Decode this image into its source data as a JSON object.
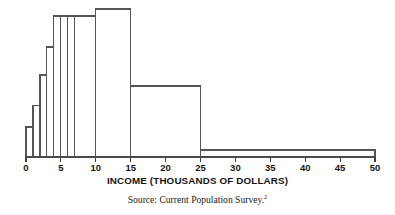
{
  "figure": {
    "axis_title": "INCOME (THOUSANDS OF DOLLARS)",
    "source_text": "Source: Current Population Survey.",
    "source_footnote_marker": "2",
    "line_color": "#555555",
    "text_color": "#141414"
  },
  "chart_data": {
    "type": "bar",
    "title": "",
    "subtitle": "",
    "xlabel": "INCOME (THOUSANDS OF DOLLARS)",
    "ylabel": "",
    "xlim": [
      0,
      50
    ],
    "ylim": [
      0,
      1
    ],
    "grid": false,
    "legend": "none",
    "note": "Histogram of family income with unequal class intervals; vertical axis is density (unlabeled, no ticks).",
    "tick_labels": [
      "0",
      "5",
      "10",
      "15",
      "20",
      "25",
      "30",
      "35",
      "40",
      "45",
      "50"
    ],
    "tick_values": [
      0,
      5,
      10,
      15,
      20,
      25,
      30,
      35,
      40,
      45,
      50
    ],
    "bins": [
      {
        "label": "0-1",
        "x0": 0,
        "x1": 1,
        "density": 0.203
      },
      {
        "label": "1-2",
        "x0": 1,
        "x1": 2,
        "density": 0.351
      },
      {
        "label": "2-3",
        "x0": 2,
        "x1": 3,
        "density": 0.554
      },
      {
        "label": "3-4",
        "x0": 3,
        "x1": 4,
        "density": 0.743
      },
      {
        "label": "4-5",
        "x0": 4,
        "x1": 5,
        "density": 0.953
      },
      {
        "label": "5-6",
        "x0": 5,
        "x1": 6,
        "density": 0.953
      },
      {
        "label": "6-7",
        "x0": 6,
        "x1": 7,
        "density": 0.953
      },
      {
        "label": "7-10",
        "x0": 7,
        "x1": 10,
        "density": 0.953
      },
      {
        "label": "10-15",
        "x0": 10,
        "x1": 15,
        "density": 1.0
      },
      {
        "label": "15-25",
        "x0": 15,
        "x1": 25,
        "density": 0.48
      },
      {
        "label": "25-50",
        "x0": 25,
        "x1": 50,
        "density": 0.047
      }
    ]
  }
}
